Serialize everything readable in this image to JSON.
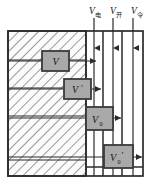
{
  "figure": {
    "kind": "schematic-diagram",
    "background_color": "#ffffff",
    "line_color": "#2b2b2b",
    "box_fill_color": "#a9a9a9",
    "box_border_color": "#3a3a3a",
    "hatch_color": "#4a4a4a",
    "hatch_background": "#fbfbfb"
  },
  "top_labels": [
    {
      "id": "channel-label-1",
      "base": "V",
      "subscript": "电",
      "x": 89
    },
    {
      "id": "channel-label-2",
      "base": "V",
      "subscript": "开",
      "x": 110
    },
    {
      "id": "channel-label-3",
      "base": "V",
      "subscript": "令",
      "x": 131
    }
  ],
  "boxes": [
    {
      "id": "box-v",
      "base": "V",
      "subscript": "",
      "prime": "",
      "x": 42,
      "y": 51,
      "width": 27,
      "height": 20
    },
    {
      "id": "box-v-prime",
      "base": "V",
      "subscript": "",
      "prime": "′",
      "x": 64,
      "y": 79,
      "width": 27,
      "height": 20
    },
    {
      "id": "box-v0",
      "base": "V",
      "subscript": "0",
      "prime": "",
      "x": 86,
      "y": 107,
      "width": 27,
      "height": 23
    },
    {
      "id": "box-v0-prime",
      "base": "V",
      "subscript": "0",
      "prime": "′",
      "x": 104,
      "y": 145,
      "width": 29,
      "height": 23
    }
  ],
  "arrows": {
    "vertical_count": 3,
    "horizontal_count": 4,
    "direction_vertical": "down",
    "direction_horizontal": "right"
  },
  "frame": {
    "x": 8,
    "y": 31,
    "width": 135,
    "height": 145,
    "hatched_region_right_edge": 86
  },
  "channel_dividers_x": [
    86,
    103,
    122,
    143
  ],
  "row_divider_y": [
    60,
    88,
    116,
    160
  ]
}
